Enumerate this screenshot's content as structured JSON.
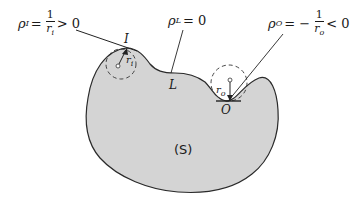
{
  "figure": {
    "type": "curvature-diagram",
    "region_label": "(S)",
    "points": [
      {
        "name": "I",
        "label": "I"
      },
      {
        "name": "L",
        "label": "L"
      },
      {
        "name": "O",
        "label": "O"
      }
    ],
    "radii": {
      "inner": "r",
      "inner_sub": "i",
      "outer": "r",
      "outer_sub": "o"
    },
    "formulas": {
      "rho_i": {
        "lhs": "ρ",
        "sub": "I",
        "eq": "=",
        "num": "1",
        "den": "r",
        "den_sub": "i",
        "rel": "> 0"
      },
      "rho_l": {
        "lhs": "ρ",
        "sub": "L",
        "eq": "= 0"
      },
      "rho_o": {
        "lhs": "ρ",
        "sub": "O",
        "eq": "= −",
        "num": "1",
        "den": "r",
        "den_sub": "o",
        "rel": "< 0"
      }
    },
    "colors": {
      "fill": "#d4d4d4",
      "stroke": "#2a2a2a",
      "text": "#1a1a1a",
      "background": "#ffffff"
    }
  }
}
